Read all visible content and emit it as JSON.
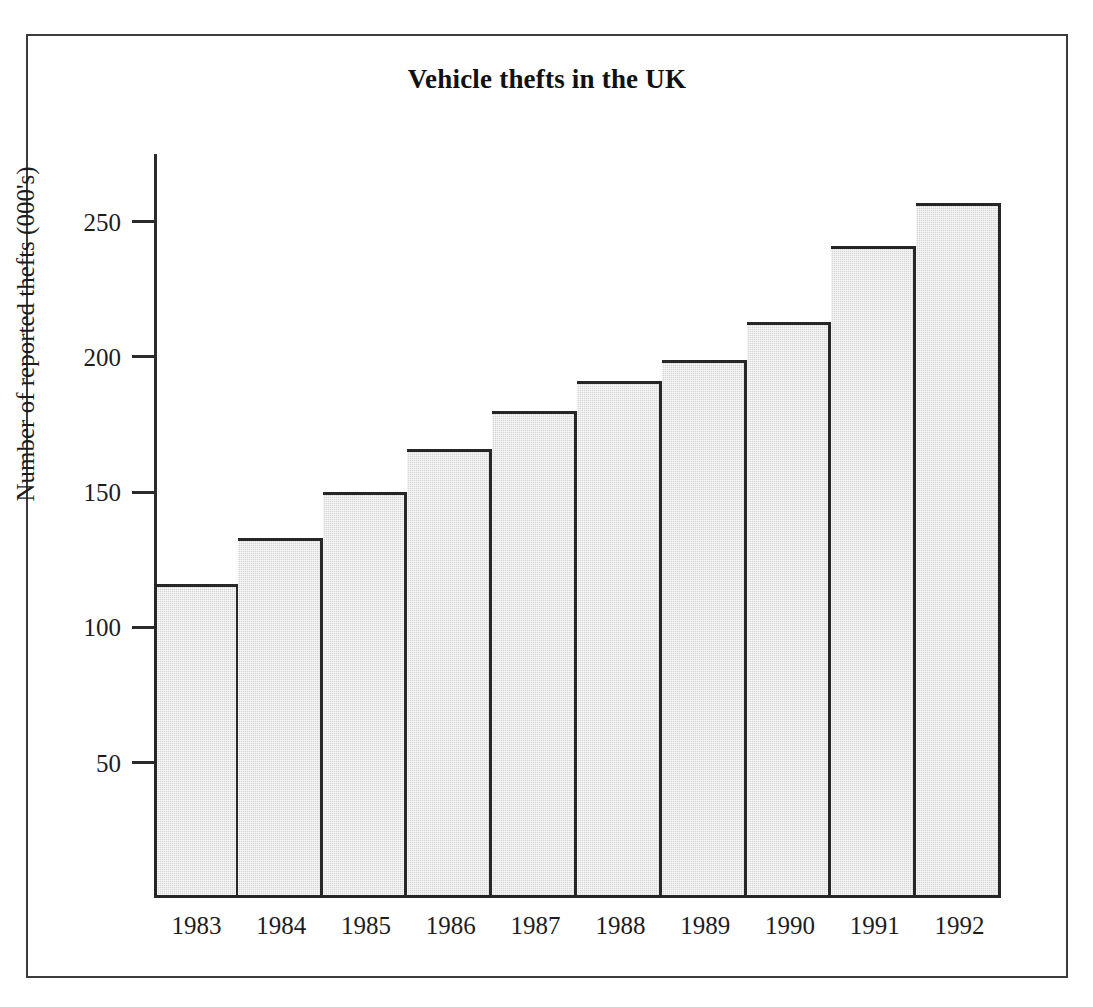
{
  "chart_data": {
    "type": "bar",
    "title": "Vehicle thefts in the UK",
    "xlabel": "",
    "ylabel": "Number of reported thefts (000's)",
    "categories": [
      "1983",
      "1984",
      "1985",
      "1986",
      "1987",
      "1988",
      "1989",
      "1990",
      "1991",
      "1992"
    ],
    "values": [
      116,
      133,
      150,
      166,
      180,
      191,
      199,
      213,
      241,
      257
    ],
    "ylim": [
      0,
      275
    ],
    "yticks": [
      50,
      100,
      150,
      200,
      250
    ],
    "ytick_labels": [
      "50",
      "100",
      "150",
      "200",
      "250"
    ],
    "grid": false,
    "legend": false,
    "bar_fill_color": "#d6d6d6",
    "bar_edge_color": "#262626",
    "axis_color": "#2b2b2b",
    "frame_color": "#3c3c3c",
    "background_color": "#ffffff"
  },
  "figure": {
    "title": "Vehicle thefts in the UK",
    "y_axis_title": "Number of reported thefts (000's)"
  }
}
